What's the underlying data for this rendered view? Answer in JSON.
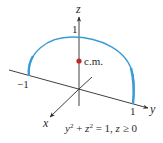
{
  "figure": {
    "axes": {
      "z_label": "z",
      "y_label": "y",
      "x_label": "x"
    },
    "ticks": {
      "z_one": "1",
      "y_neg_one": "−1",
      "y_one": "1"
    },
    "center_of_mass": {
      "label": "c.m."
    },
    "equation": {
      "y": "y",
      "plus": " + ",
      "z": "z",
      "exp1": "2",
      "exp2": "2",
      "rest": " = 1, ",
      "cond_var": "z",
      "cond": " ≥ 0"
    },
    "colors": {
      "arc": "#3a9bd6",
      "axes": "#2a2a2a",
      "center_of_mass_dot": "#c0282a"
    }
  }
}
